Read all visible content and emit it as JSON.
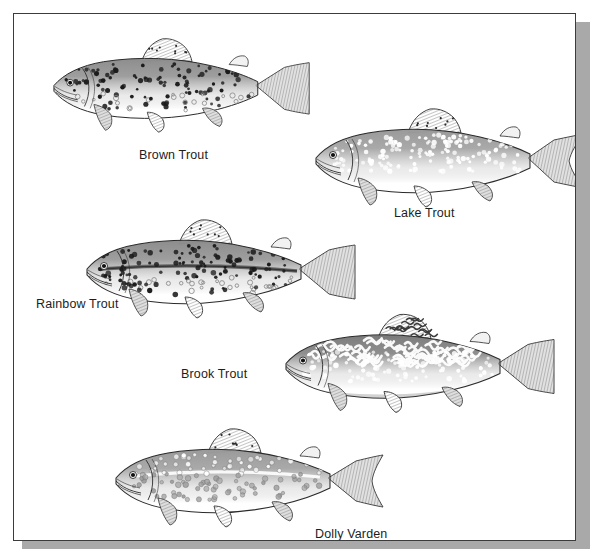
{
  "plate": {
    "background_color": "#ffffff",
    "frame_border_color": "#3c3c3c",
    "frame_shadow_color": "#a9a9a9",
    "ink_color": "#1d1d1d"
  },
  "figure": {
    "type": "illustration-plate",
    "medium": "grayscale line drawing",
    "species_count": 5
  },
  "species": [
    {
      "id": "brown-trout",
      "label": "Brown Trout",
      "label_x": 125,
      "label_y": 134,
      "fish_x": 14,
      "fish_y": 22,
      "fish_w": 290,
      "fish_h": 100,
      "facing": "left",
      "body_tone": "#8d8d8d",
      "spot_color": "#1a1a1a",
      "spot_style": "dark-round-spots-with-halos",
      "tail_shape": "square",
      "has_lateral_stripe": false,
      "has_vermiculation": false,
      "spot_count": 150
    },
    {
      "id": "lake-trout",
      "label": "Lake Trout",
      "label_x": 380,
      "label_y": 192,
      "fish_x": 282,
      "fish_y": 92,
      "fish_w": 290,
      "fish_h": 105,
      "facing": "left",
      "body_tone": "#9a9a9a",
      "spot_color": "#ffffff",
      "spot_style": "pale-round-spots",
      "tail_shape": "deeply-forked",
      "has_lateral_stripe": false,
      "has_vermiculation": false,
      "spot_count": 150
    },
    {
      "id": "rainbow-trout",
      "label": "Rainbow Trout",
      "label_x": 22,
      "label_y": 283,
      "fish_x": 53,
      "fish_y": 203,
      "fish_w": 290,
      "fish_h": 105,
      "facing": "left",
      "body_tone": "#8d8d8d",
      "spot_color": "#1a1a1a",
      "spot_style": "dark-speckles-and-spotted-tail",
      "tail_shape": "square-spotted",
      "has_lateral_stripe": true,
      "has_vermiculation": false,
      "spot_count": 170
    },
    {
      "id": "brook-trout",
      "label": "Brook Trout",
      "label_x": 167,
      "label_y": 353,
      "fish_x": 252,
      "fish_y": 295,
      "fish_w": 290,
      "fish_h": 110,
      "facing": "left",
      "body_tone": "#7c7c7c",
      "spot_color": "#ffffff",
      "spot_style": "vermiculated-back-with-pale-spots",
      "tail_shape": "square",
      "has_lateral_stripe": false,
      "has_vermiculation": true,
      "spot_count": 110
    },
    {
      "id": "dolly-varden",
      "label": "Dolly Varden",
      "label_x": 301,
      "label_y": 513,
      "fish_x": 82,
      "fish_y": 412,
      "fish_w": 290,
      "fish_h": 105,
      "facing": "left",
      "body_tone": "#9a9a9a",
      "spot_color": "#c7c7c7",
      "spot_style": "pale-round-spots-with-light-lateral-line",
      "tail_shape": "slightly-forked",
      "has_lateral_stripe": true,
      "has_vermiculation": false,
      "spot_count": 120
    }
  ]
}
